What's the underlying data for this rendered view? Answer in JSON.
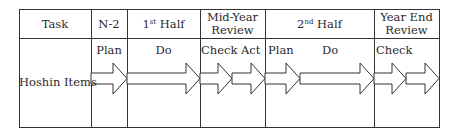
{
  "header": {
    "task": "Task",
    "n2": "N-2",
    "first_half_num": "1",
    "first_half_sup": "st",
    "first_half_rest": " Half",
    "mid_year_line1": "Mid-Year",
    "mid_year_line2": "Review",
    "second_half_num": "2",
    "second_half_sup": "nd",
    "second_half_rest": " Half",
    "year_end_line1": "Year End",
    "year_end_line2": "Review"
  },
  "row": {
    "label": "Hoshin Items",
    "phases": [
      "Plan",
      "Do",
      "Check",
      "Act",
      "Plan",
      "Do",
      "Check"
    ]
  },
  "colors": {
    "line": "#333333",
    "background": "#ffffff"
  }
}
